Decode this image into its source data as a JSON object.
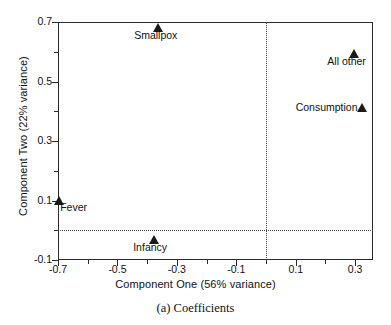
{
  "figure": {
    "caption": "(a) Coefficients"
  },
  "chart_data": {
    "type": "scatter",
    "title": "",
    "xlabel": "Component One (56% variance)",
    "ylabel": "Component Two (22% variance)",
    "xlim": [
      -0.7,
      0.36
    ],
    "ylim": [
      -0.1,
      0.7
    ],
    "xticks": [
      -0.7,
      -0.5,
      -0.3,
      -0.1,
      0.1,
      0.3
    ],
    "xticklabels": [
      "-0.7",
      "-0.5",
      "-0.3",
      "-0.1",
      "0.1",
      "0.3"
    ],
    "xminorticks": [
      -0.6,
      -0.4,
      -0.2,
      0.0,
      0.2
    ],
    "yticks": [
      -0.1,
      0.1,
      0.3,
      0.5,
      0.7
    ],
    "yticklabels": [
      "-0.1",
      "0.1",
      "0.3",
      "0.5",
      "0.7"
    ],
    "yminorticks": [
      0.0,
      0.2,
      0.4,
      0.6
    ],
    "grid": false,
    "legend": "none",
    "reference_lines": {
      "horizontal": 0.0,
      "vertical": 0.0,
      "style": "dotted"
    },
    "marker_style": "filled-triangle-up",
    "marker_color": "#1a1a1a",
    "points": [
      {
        "label": "Smallpox",
        "x": -0.365,
        "y": 0.681,
        "label_pos": "below"
      },
      {
        "label": "All other",
        "x": 0.295,
        "y": 0.593,
        "label_pos": "below"
      },
      {
        "label": "Consumption",
        "x": 0.323,
        "y": 0.412,
        "label_pos": "left"
      },
      {
        "label": "Fever",
        "x": -0.696,
        "y": 0.097,
        "label_pos": "below-right"
      },
      {
        "label": "Infancy",
        "x": -0.378,
        "y": -0.034,
        "label_pos": "below"
      }
    ]
  }
}
